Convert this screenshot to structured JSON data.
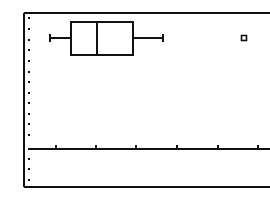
{
  "screen": {
    "type": "calculator-graph-screen",
    "ink_color": "#111111",
    "background_color": "#ffffff"
  },
  "frame": {
    "left": 24,
    "top": 13,
    "bottom": 187,
    "right_open": true
  },
  "axis": {
    "x_axis_y": 149,
    "x_ticks_px": [
      56,
      96,
      136,
      177,
      218,
      258
    ],
    "y_dots_x": 29,
    "y_dots_px": [
      18,
      29,
      40,
      50,
      61,
      72,
      82,
      93,
      103,
      114,
      124,
      135,
      159,
      169,
      180
    ]
  },
  "chart_data": {
    "type": "boxplot",
    "title": "",
    "xlabel": "",
    "ylabel": "",
    "grid": false,
    "x_tick_count": 6,
    "series": [
      {
        "name": "Plot1",
        "orientation": "horizontal",
        "whisker_low_px": 50,
        "q1_px": 71,
        "median_px": 97,
        "q3_px": 133,
        "whisker_high_px": 163,
        "outliers_px": [
          244
        ],
        "box_top_px": 22,
        "box_bottom_px": 55,
        "center_y_px": 38
      }
    ],
    "note": "Modified box plot with one outlier; no numeric labels shown on screen"
  }
}
